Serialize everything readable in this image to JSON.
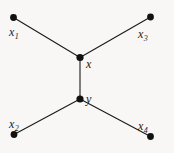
{
  "figure": {
    "kind": "graph-diagram",
    "background_color": "#f8f7f5",
    "stroke_color": "#1a1a1a",
    "node_fill_color": "#111111"
  },
  "nodes": [
    {
      "id": "x1",
      "label": "x",
      "sub": "1",
      "cx": 13.5,
      "cy": 17.5,
      "r": 3.4,
      "label_x": 9,
      "label_y": 26
    },
    {
      "id": "x3",
      "label": "x",
      "sub": "3",
      "cx": 150.5,
      "cy": 17.0,
      "r": 3.4,
      "label_x": 138,
      "label_y": 28
    },
    {
      "id": "x",
      "label": "x",
      "sub": "",
      "cx": 80.0,
      "cy": 57.5,
      "r": 3.6,
      "label_x": 86,
      "label_y": 58
    },
    {
      "id": "y",
      "label": "y",
      "sub": "",
      "cx": 80.0,
      "cy": 99.0,
      "r": 3.6,
      "label_x": 86,
      "label_y": 93
    },
    {
      "id": "x2",
      "label": "x",
      "sub": "2",
      "cx": 14.0,
      "cy": 134.5,
      "r": 3.4,
      "label_x": 9,
      "label_y": 118
    },
    {
      "id": "x4",
      "label": "x",
      "sub": "4",
      "cx": 150.5,
      "cy": 136.5,
      "r": 3.4,
      "label_x": 138,
      "label_y": 120
    }
  ],
  "edges": [
    {
      "id": "edge-x1-x",
      "from": "x1",
      "to": "x",
      "x1": 13.5,
      "y1": 17.5,
      "x2": 80.0,
      "y2": 57.5
    },
    {
      "id": "edge-x3-x",
      "from": "x3",
      "to": "x",
      "x1": 150.5,
      "y1": 17.0,
      "x2": 80.0,
      "y2": 57.5
    },
    {
      "id": "edge-x-y",
      "from": "x",
      "to": "y",
      "x1": 80.0,
      "y1": 57.5,
      "x2": 80.0,
      "y2": 99.0
    },
    {
      "id": "edge-y-x2",
      "from": "y",
      "to": "x2",
      "x1": 80.0,
      "y1": 99.0,
      "x2": 14.0,
      "y2": 134.5
    },
    {
      "id": "edge-y-x4",
      "from": "y",
      "to": "x4",
      "x1": 80.0,
      "y1": 99.0,
      "x2": 150.5,
      "y2": 136.5
    }
  ],
  "labels": {
    "x1": "x",
    "x1_sub": "1",
    "x2": "x",
    "x2_sub": "2",
    "x3": "x",
    "x3_sub": "3",
    "x4": "x",
    "x4_sub": "4",
    "x": "x",
    "y": "y"
  }
}
